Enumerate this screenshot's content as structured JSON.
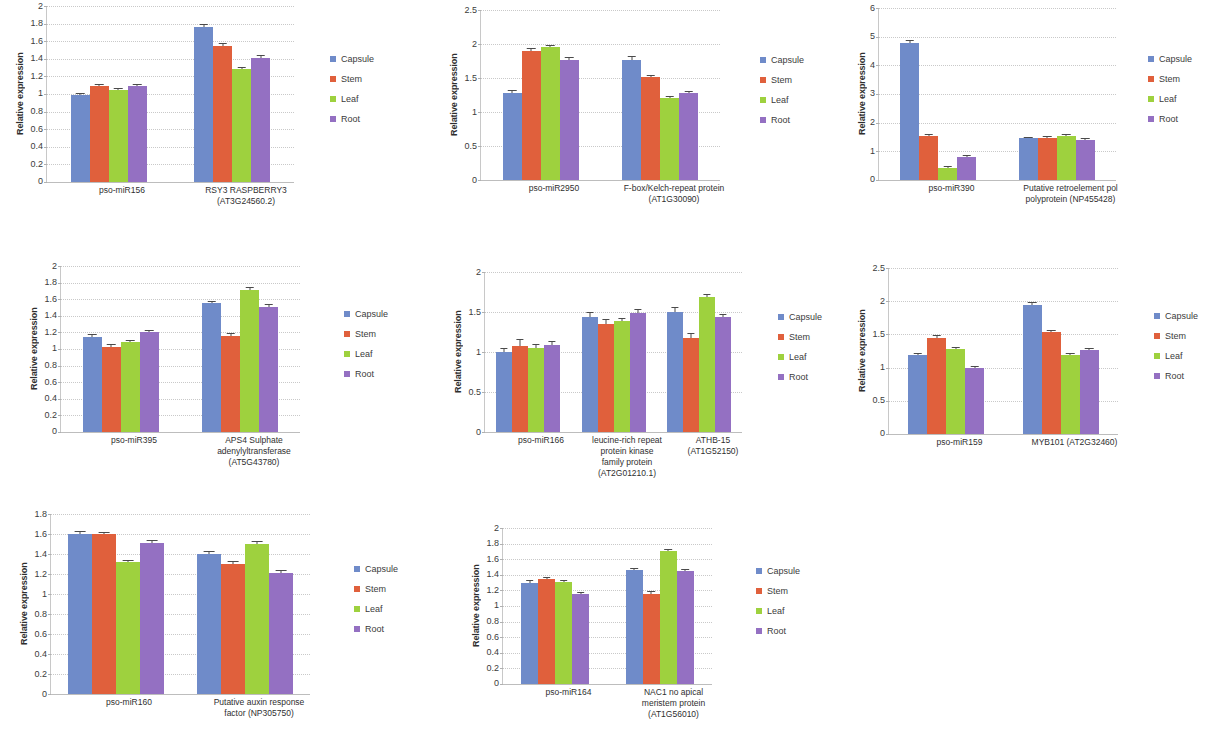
{
  "figure": {
    "ylabel": "Relative expression",
    "series_colors": {
      "Capsule": "#6f8bc9",
      "Stem": "#e0603c",
      "Leaf": "#9ed13e",
      "Root": "#9470c2"
    },
    "legend_labels": [
      "Capsule",
      "Stem",
      "Leaf",
      "Root"
    ]
  },
  "chart_data": [
    {
      "id": "panel-1",
      "type": "bar",
      "title": "",
      "xlabel": "",
      "ylabel": "Relative expression",
      "ylim": [
        0,
        2
      ],
      "yticks": [
        "0",
        "0.2",
        "0.4",
        "0.6",
        "0.8",
        "1",
        "1.2",
        "1.4",
        "1.6",
        "1.8",
        "2"
      ],
      "grid": true,
      "legend_position": "right",
      "categories": [
        "pso-miR156",
        "RSY3 RASPBERRY3\n(AT3G24560.2)"
      ],
      "category_lines": [
        [
          "pso-miR156"
        ],
        [
          "RSY3 RASPBERRY3",
          "(AT3G24560.2)"
        ]
      ],
      "series": [
        {
          "name": "Capsule",
          "values": [
            0.99,
            1.76
          ],
          "errors": [
            0.015,
            0.02
          ]
        },
        {
          "name": "Stem",
          "values": [
            1.09,
            1.55
          ],
          "errors": [
            0.015,
            0.02
          ]
        },
        {
          "name": "Leaf",
          "values": [
            1.05,
            1.28
          ],
          "errors": [
            0.01,
            0.015
          ]
        },
        {
          "name": "Root",
          "values": [
            1.09,
            1.41
          ],
          "errors": [
            0.015,
            0.02
          ]
        }
      ]
    },
    {
      "id": "panel-2",
      "type": "bar",
      "title": "",
      "xlabel": "",
      "ylabel": "Relative expression",
      "ylim": [
        0,
        2.5
      ],
      "yticks": [
        "0",
        "0.5",
        "1",
        "1.5",
        "2",
        "2.5"
      ],
      "grid": true,
      "legend_position": "right",
      "categories": [
        "pso-miR2950",
        "F-box/Kelch-repeat protein\n(AT1G30090)"
      ],
      "category_lines": [
        [
          "pso-miR2950"
        ],
        [
          "F-box/Kelch-repeat protein",
          "(AT1G30090)"
        ]
      ],
      "series": [
        {
          "name": "Capsule",
          "values": [
            1.28,
            1.77
          ],
          "errors": [
            0.035,
            0.045
          ]
        },
        {
          "name": "Stem",
          "values": [
            1.9,
            1.51
          ],
          "errors": [
            0.02,
            0.02
          ]
        },
        {
          "name": "Leaf",
          "values": [
            1.95,
            1.2
          ],
          "errors": [
            0.025,
            0.02
          ]
        },
        {
          "name": "Root",
          "values": [
            1.77,
            1.28
          ],
          "errors": [
            0.02,
            0.02
          ]
        }
      ]
    },
    {
      "id": "panel-3",
      "type": "bar",
      "title": "",
      "xlabel": "",
      "ylabel": "Relative expression",
      "ylim": [
        0,
        6
      ],
      "yticks": [
        "0",
        "1",
        "2",
        "3",
        "4",
        "5",
        "6"
      ],
      "grid": true,
      "legend_position": "right",
      "categories": [
        "pso-miR390",
        "Putative retroelement pol\npolyprotein (NP455428)"
      ],
      "category_lines": [
        [
          "pso-miR390"
        ],
        [
          "Putative retroelement pol",
          "polyprotein (NP455428)"
        ]
      ],
      "series": [
        {
          "name": "Capsule",
          "values": [
            4.78,
            1.45
          ],
          "errors": [
            0.08,
            0.03
          ]
        },
        {
          "name": "Stem",
          "values": [
            1.53,
            1.46
          ],
          "errors": [
            0.04,
            0.03
          ]
        },
        {
          "name": "Leaf",
          "values": [
            0.42,
            1.52
          ],
          "errors": [
            0.03,
            0.04
          ]
        },
        {
          "name": "Root",
          "values": [
            0.82,
            1.41
          ],
          "errors": [
            0.03,
            0.03
          ]
        }
      ]
    },
    {
      "id": "panel-4",
      "type": "bar",
      "title": "",
      "xlabel": "",
      "ylabel": "Relative expression",
      "ylim": [
        0,
        2
      ],
      "yticks": [
        "0",
        "0.2",
        "0.4",
        "0.6",
        "0.8",
        "1",
        "1.2",
        "1.4",
        "1.6",
        "1.8",
        "2"
      ],
      "grid": true,
      "legend_position": "right",
      "categories": [
        "pso-miR395",
        "APS4 Sulphate\nadenylyltransferase\n(AT5G43780)"
      ],
      "category_lines": [
        [
          "pso-miR395"
        ],
        [
          "APS4 Sulphate",
          "adenylyltransferase",
          "(AT5G43780)"
        ]
      ],
      "series": [
        {
          "name": "Capsule",
          "values": [
            1.15,
            1.55
          ],
          "errors": [
            0.015,
            0.02
          ]
        },
        {
          "name": "Stem",
          "values": [
            1.03,
            1.16
          ],
          "errors": [
            0.015,
            0.015
          ]
        },
        {
          "name": "Leaf",
          "values": [
            1.08,
            1.71
          ],
          "errors": [
            0.015,
            0.02
          ]
        },
        {
          "name": "Root",
          "values": [
            1.2,
            1.51
          ],
          "errors": [
            0.015,
            0.02
          ]
        }
      ]
    },
    {
      "id": "panel-5",
      "type": "bar",
      "title": "",
      "xlabel": "",
      "ylabel": "Relative expression",
      "ylim": [
        0,
        2
      ],
      "yticks": [
        "0",
        "0.5",
        "1",
        "1.5",
        "2"
      ],
      "grid": true,
      "legend_position": "right",
      "categories": [
        "pso-miR166",
        "leucine-rich repeat\nprotein kinase\nfamily protein\n(AT2G01210.1)",
        "ATHB-15\n(AT1G52150)"
      ],
      "category_lines": [
        [
          "pso-miR166"
        ],
        [
          "leucine-rich repeat",
          "protein kinase",
          "family protein",
          "(AT2G01210.1)"
        ],
        [
          "ATHB-15",
          "(AT1G52150)"
        ]
      ],
      "series": [
        {
          "name": "Capsule",
          "values": [
            1.0,
            1.44,
            1.5
          ],
          "errors": [
            0.04,
            0.05,
            0.055
          ]
        },
        {
          "name": "Stem",
          "values": [
            1.08,
            1.35,
            1.17
          ],
          "errors": [
            0.065,
            0.055,
            0.06
          ]
        },
        {
          "name": "Leaf",
          "values": [
            1.05,
            1.39,
            1.69
          ],
          "errors": [
            0.035,
            0.025,
            0.02
          ]
        },
        {
          "name": "Root",
          "values": [
            1.09,
            1.49,
            1.44
          ],
          "errors": [
            0.03,
            0.03,
            0.025
          ]
        }
      ]
    },
    {
      "id": "panel-6",
      "type": "bar",
      "title": "",
      "xlabel": "",
      "ylabel": "Relative expression",
      "ylim": [
        0,
        2.5
      ],
      "yticks": [
        "0",
        "0.5",
        "1",
        "1.5",
        "2",
        "2.5"
      ],
      "grid": true,
      "legend_position": "right",
      "categories": [
        "pso-miR159",
        "MYB101 (AT2G32460)"
      ],
      "category_lines": [
        [
          "pso-miR159"
        ],
        [
          "MYB101 (AT2G32460)"
        ]
      ],
      "series": [
        {
          "name": "Capsule",
          "values": [
            1.19,
            1.95
          ],
          "errors": [
            0.015,
            0.02
          ]
        },
        {
          "name": "Stem",
          "values": [
            1.45,
            1.53
          ],
          "errors": [
            0.02,
            0.02
          ]
        },
        {
          "name": "Leaf",
          "values": [
            1.28,
            1.19
          ],
          "errors": [
            0.015,
            0.015
          ]
        },
        {
          "name": "Root",
          "values": [
            0.99,
            1.26
          ],
          "errors": [
            0.015,
            0.015
          ]
        }
      ]
    },
    {
      "id": "panel-7",
      "type": "bar",
      "title": "",
      "xlabel": "",
      "ylabel": "Relative expression",
      "ylim": [
        0,
        1.8
      ],
      "yticks": [
        "0",
        "0.2",
        "0.4",
        "0.6",
        "0.8",
        "1",
        "1.2",
        "1.4",
        "1.6",
        "1.8"
      ],
      "grid": true,
      "legend_position": "right",
      "categories": [
        "pso-miR160",
        "Putative auxin response\nfactor (NP305750)"
      ],
      "category_lines": [
        [
          "pso-miR160"
        ],
        [
          "Putative auxin response",
          "factor (NP305750)"
        ]
      ],
      "series": [
        {
          "name": "Capsule",
          "values": [
            1.6,
            1.4
          ],
          "errors": [
            0.02,
            0.02
          ]
        },
        {
          "name": "Stem",
          "values": [
            1.6,
            1.3
          ],
          "errors": [
            0.015,
            0.02
          ]
        },
        {
          "name": "Leaf",
          "values": [
            1.32,
            1.5
          ],
          "errors": [
            0.015,
            0.02
          ]
        },
        {
          "name": "Root",
          "values": [
            1.51,
            1.21
          ],
          "errors": [
            0.02,
            0.02
          ]
        }
      ]
    },
    {
      "id": "panel-8",
      "type": "bar",
      "title": "",
      "xlabel": "",
      "ylabel": "Relative expression",
      "ylim": [
        0,
        2
      ],
      "yticks": [
        "0",
        "0.2",
        "0.4",
        "0.6",
        "0.8",
        "1",
        "1.2",
        "1.4",
        "1.6",
        "1.8",
        "2"
      ],
      "grid": true,
      "legend_position": "right",
      "categories": [
        "pso-miR164",
        "NAC1 no apical\nmeristem protein\n(AT1G56010)"
      ],
      "category_lines": [
        [
          "pso-miR164"
        ],
        [
          "NAC1 no apical",
          "meristem protein",
          "(AT1G56010)"
        ]
      ],
      "series": [
        {
          "name": "Capsule",
          "values": [
            1.3,
            1.46
          ],
          "errors": [
            0.015,
            0.015
          ]
        },
        {
          "name": "Stem",
          "values": [
            1.34,
            1.16
          ],
          "errors": [
            0.015,
            0.015
          ]
        },
        {
          "name": "Leaf",
          "values": [
            1.31,
            1.7
          ],
          "errors": [
            0.015,
            0.02
          ]
        },
        {
          "name": "Root",
          "values": [
            1.16,
            1.45
          ],
          "errors": [
            0.01,
            0.015
          ]
        }
      ]
    }
  ],
  "panel_layout": [
    {
      "id": "panel-1",
      "left": 14,
      "top": 6,
      "plot_w": 248,
      "plot_h": 176,
      "legend_gap": 22,
      "bar_w": 19,
      "group_gap": 0
    },
    {
      "id": "panel-2",
      "left": 448,
      "top": 10,
      "plot_w": 240,
      "plot_h": 170,
      "legend_gap": 26,
      "bar_w": 19,
      "group_gap": 0
    },
    {
      "id": "panel-3",
      "left": 856,
      "top": 8,
      "plot_w": 238,
      "plot_h": 172,
      "legend_gap": 18,
      "bar_w": 19,
      "group_gap": 0
    },
    {
      "id": "panel-4",
      "left": 28,
      "top": 266,
      "plot_w": 240,
      "plot_h": 166,
      "legend_gap": 30,
      "bar_w": 19,
      "group_gap": 0
    },
    {
      "id": "panel-5",
      "left": 452,
      "top": 272,
      "plot_w": 258,
      "plot_h": 160,
      "legend_gap": 22,
      "bar_w": 16,
      "group_gap": 0
    },
    {
      "id": "panel-6",
      "left": 856,
      "top": 268,
      "plot_w": 230,
      "plot_h": 166,
      "legend_gap": 22,
      "bar_w": 19,
      "group_gap": 0
    },
    {
      "id": "panel-7",
      "left": 18,
      "top": 514,
      "plot_w": 260,
      "plot_h": 180,
      "legend_gap": 30,
      "bar_w": 24,
      "group_gap": 0
    },
    {
      "id": "panel-8",
      "left": 470,
      "top": 528,
      "plot_w": 210,
      "plot_h": 156,
      "legend_gap": 30,
      "bar_w": 17,
      "group_gap": 0
    }
  ]
}
